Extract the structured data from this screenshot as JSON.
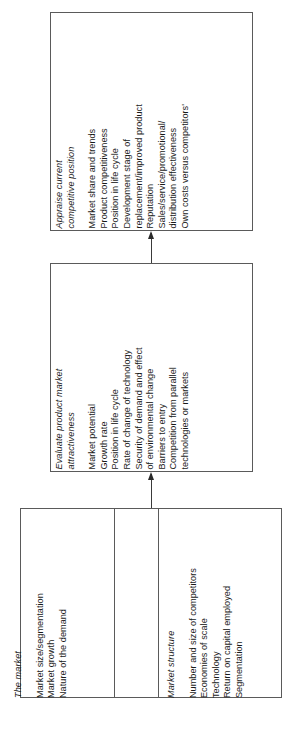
{
  "diagram": {
    "type": "flow-chart",
    "orientation": "rotated-90-ccw",
    "flow_direction": "bottom-to-top",
    "boxes": [
      {
        "id": "appraise",
        "groups": [
          {
            "title": "Appraise current\ncompetitive position",
            "items": [
              "Market share and trends",
              "Product competitiveness",
              "Position in life cycle",
              "Development stage of\nreplacement/improved product",
              "Reputation",
              "Sales/service/promotional/\ndistribution effectiveness",
              "Own costs versus competitors'"
            ]
          }
        ]
      },
      {
        "id": "evaluate",
        "groups": [
          {
            "title": "Evaluate product market\nattractiveness",
            "items": [
              "Market potential",
              "Growth rate",
              "Position in life cycle",
              "Rate of change of technology",
              "Security of demand and effect\nof environmental change",
              "Barriers to entry",
              "Competition from parallel\ntechnologies or markets"
            ]
          }
        ]
      },
      {
        "id": "market",
        "groups": [
          {
            "title": "The market",
            "items": [
              "Market size/segmentation",
              "Market growth",
              "Nature of the demand"
            ]
          },
          {
            "title": "Market structure",
            "items": [
              "Number and size of competitors",
              "Economies of scale",
              "Technology",
              "Return on capital employed",
              "Segmentation"
            ]
          }
        ]
      }
    ],
    "connectors": [
      {
        "id": "market-to-evaluate",
        "from": "market",
        "to": "evaluate",
        "arrow": "arrowhead"
      },
      {
        "id": "evaluate-to-appraise",
        "from": "evaluate",
        "to": "appraise",
        "arrow": "arrowhead"
      }
    ],
    "colors": {
      "box_border": "#5a5a5a",
      "connector": "#3a3a3a",
      "text": "#1a1a1a",
      "background": "#ffffff"
    }
  }
}
